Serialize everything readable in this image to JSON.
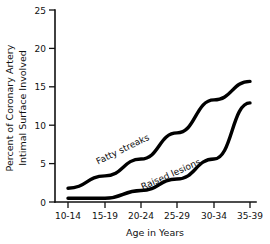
{
  "chart_data": {
    "type": "line",
    "title": "",
    "xlabel": "Age in Years",
    "ylabel_line1": "Percent of Coronary Artery",
    "ylabel_line2": "Intimal Surface Involved",
    "categories": [
      "10-14",
      "15-19",
      "20-24",
      "25-29",
      "30-34",
      "35-39"
    ],
    "ylim": [
      0,
      25
    ],
    "yticks": [
      0,
      5,
      10,
      15,
      20,
      25
    ],
    "ytick_labels": [
      "0",
      "5",
      "10",
      "15",
      "20",
      "25"
    ],
    "grid": false,
    "legend_position": "inline-labels",
    "series": [
      {
        "name": "Fatty streaks",
        "values": [
          1.8,
          3.4,
          5.6,
          9.0,
          13.3,
          15.7
        ],
        "color": "#000000"
      },
      {
        "name": "Raised lesions",
        "values": [
          0.5,
          0.5,
          1.5,
          3.0,
          5.6,
          12.9
        ],
        "color": "#000000"
      }
    ]
  },
  "axis": {
    "y_label_line1": "Percent of Coronary Artery",
    "y_label_line2": "Intimal Surface Involved",
    "x_label": "Age in Years",
    "y_tick_0": "0",
    "y_tick_5": "5",
    "y_tick_10": "10",
    "y_tick_15": "15",
    "y_tick_20": "20",
    "y_tick_25": "25",
    "x_tick_0": "10-14",
    "x_tick_1": "15-19",
    "x_tick_2": "20-24",
    "x_tick_3": "25-29",
    "x_tick_4": "30-34",
    "x_tick_5": "35-39"
  },
  "series_labels": {
    "fatty_streaks": "Fatty streaks",
    "raised_lesions": "Raised lesions"
  }
}
